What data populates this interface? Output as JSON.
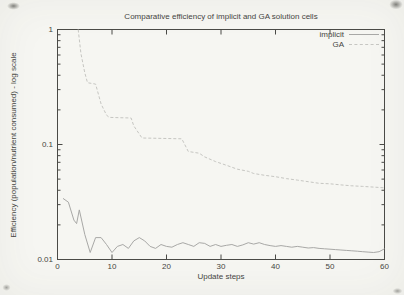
{
  "colors": {
    "background": "#f6f6f2",
    "axis": "#4a4a46",
    "text": "#45453f",
    "implicit_line": "#a8a8a6",
    "ga_line": "#c6c6c2"
  },
  "chart_data": {
    "type": "line",
    "title": "Comparative efficiency of implicit and GA solution cells",
    "xlabel": "Update steps",
    "ylabel": "Efficiency (population/nutrient consumed) - log scale",
    "grid": false,
    "legend_position": "top-right-inside",
    "x_axis": {
      "min": 0,
      "max": 60,
      "ticks": [
        {
          "v": 0,
          "label": "0"
        },
        {
          "v": 10,
          "label": "10"
        },
        {
          "v": 20,
          "label": "20"
        },
        {
          "v": 30,
          "label": "30"
        },
        {
          "v": 40,
          "label": "40"
        },
        {
          "v": 50,
          "label": "50"
        },
        {
          "v": 60,
          "label": "60"
        }
      ]
    },
    "y_axis": {
      "scale": "log",
      "min": 0.01,
      "max": 1,
      "ticks": [
        {
          "v": 1,
          "label": "1"
        },
        {
          "v": 0.1,
          "label": "0.1"
        },
        {
          "v": 0.01,
          "label": "0.01"
        }
      ]
    },
    "series": [
      {
        "name": "implicit",
        "style": "solid",
        "color": "#a8a8a6",
        "points": [
          [
            1,
            0.034
          ],
          [
            2,
            0.0315
          ],
          [
            3,
            0.022
          ],
          [
            3.5,
            0.0205
          ],
          [
            4,
            0.027
          ],
          [
            5,
            0.0165
          ],
          [
            6,
            0.0115
          ],
          [
            7,
            0.0155
          ],
          [
            8,
            0.0155
          ],
          [
            9,
            0.0135
          ],
          [
            10,
            0.0115
          ],
          [
            11,
            0.013
          ],
          [
            12,
            0.0135
          ],
          [
            13,
            0.0125
          ],
          [
            14,
            0.0145
          ],
          [
            15,
            0.0155
          ],
          [
            16,
            0.0145
          ],
          [
            17,
            0.013
          ],
          [
            18,
            0.0125
          ],
          [
            19,
            0.0135
          ],
          [
            20,
            0.013
          ],
          [
            21,
            0.0128
          ],
          [
            22,
            0.0135
          ],
          [
            23,
            0.014
          ],
          [
            24,
            0.0135
          ],
          [
            25,
            0.013
          ],
          [
            26,
            0.014
          ],
          [
            27,
            0.0138
          ],
          [
            28,
            0.013
          ],
          [
            29,
            0.0135
          ],
          [
            30,
            0.013
          ],
          [
            31,
            0.0133
          ],
          [
            32,
            0.0135
          ],
          [
            33,
            0.013
          ],
          [
            34,
            0.0134
          ],
          [
            35,
            0.014
          ],
          [
            36,
            0.0136
          ],
          [
            37,
            0.014
          ],
          [
            38,
            0.0135
          ],
          [
            39,
            0.0132
          ],
          [
            40,
            0.013
          ],
          [
            41,
            0.0132
          ],
          [
            42,
            0.013
          ],
          [
            43,
            0.0128
          ],
          [
            44,
            0.013
          ],
          [
            45,
            0.0128
          ],
          [
            46,
            0.0126
          ],
          [
            47,
            0.0127
          ],
          [
            48,
            0.0125
          ],
          [
            49,
            0.0124
          ],
          [
            50,
            0.0123
          ],
          [
            51,
            0.0122
          ],
          [
            52,
            0.0121
          ],
          [
            53,
            0.012
          ],
          [
            54,
            0.0119
          ],
          [
            55,
            0.0118
          ],
          [
            56,
            0.0117
          ],
          [
            57,
            0.0116
          ],
          [
            58,
            0.0115
          ],
          [
            59,
            0.0117
          ],
          [
            60,
            0.0124
          ]
        ]
      },
      {
        "name": "GA",
        "style": "dashed",
        "color": "#c6c6c2",
        "points": [
          [
            3.8,
            1.0
          ],
          [
            4.3,
            0.62
          ],
          [
            5,
            0.42
          ],
          [
            5.5,
            0.345
          ],
          [
            7,
            0.335
          ],
          [
            8,
            0.225
          ],
          [
            9,
            0.18
          ],
          [
            9.5,
            0.172
          ],
          [
            13.5,
            0.17
          ],
          [
            14,
            0.145
          ],
          [
            15.5,
            0.114
          ],
          [
            22.8,
            0.112
          ],
          [
            24,
            0.087
          ],
          [
            26,
            0.084
          ],
          [
            27,
            0.078
          ],
          [
            29,
            0.071
          ],
          [
            31,
            0.066
          ],
          [
            33,
            0.061
          ],
          [
            35,
            0.0585
          ],
          [
            36,
            0.056
          ],
          [
            38,
            0.054
          ],
          [
            40,
            0.0525
          ],
          [
            42,
            0.0505
          ],
          [
            44,
            0.049
          ],
          [
            46,
            0.0475
          ],
          [
            48,
            0.046
          ],
          [
            50,
            0.0455
          ],
          [
            52,
            0.0445
          ],
          [
            54,
            0.0437
          ],
          [
            56,
            0.0432
          ],
          [
            58,
            0.0426
          ],
          [
            60,
            0.042
          ]
        ]
      }
    ]
  }
}
